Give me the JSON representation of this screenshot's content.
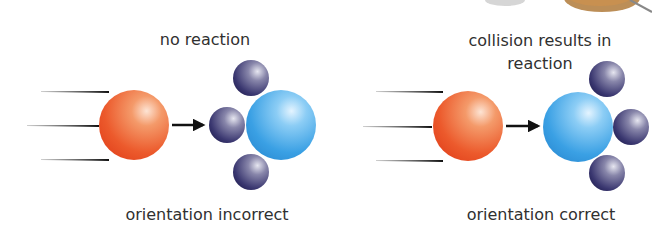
{
  "panels": [
    {
      "id": "left",
      "title": "no reaction",
      "caption": "orientation incorrect",
      "orientation_correct": false
    },
    {
      "id": "right",
      "title_line1": "collision results in",
      "title_line2": "reaction",
      "caption": "orientation correct",
      "orientation_correct": true
    }
  ],
  "colors": {
    "incoming_molecule": "#ee5a2e",
    "central_atom": "#3aa0e4",
    "attached_atom": "#3a3770",
    "arrow": "#111111",
    "text": "#303030"
  },
  "icons": {
    "motion": "speed-lines-icon",
    "direction": "arrow-right-icon"
  }
}
